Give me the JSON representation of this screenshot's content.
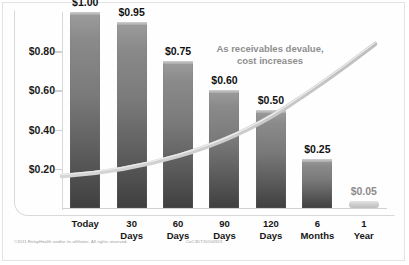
{
  "chart_data": {
    "type": "bar",
    "title": "",
    "subtitle": "",
    "xlabel": "",
    "ylabel": "",
    "categories": [
      "Today",
      "30\nDays",
      "60\nDays",
      "90\nDays",
      "120\nDays",
      "6\nMonths",
      "1\nYear"
    ],
    "category_lines": [
      [
        "Today"
      ],
      [
        "30",
        "Days"
      ],
      [
        "60",
        "Days"
      ],
      [
        "90",
        "Days"
      ],
      [
        "120",
        "Days"
      ],
      [
        "6",
        "Months"
      ],
      [
        "1",
        "Year"
      ]
    ],
    "values": [
      1.0,
      0.95,
      0.75,
      0.6,
      0.5,
      0.25,
      0.05
    ],
    "value_labels": [
      "$1.00",
      "$0.95",
      "$0.75",
      "$0.60",
      "$0.50",
      "$0.25",
      "$0.05"
    ],
    "ylim": [
      0,
      1.0
    ],
    "ytick_values": [
      0.8,
      0.6,
      0.4,
      0.2
    ],
    "ytick_labels": [
      "$0.80",
      "$0.60",
      "$0.40",
      "$0.20"
    ],
    "grid": false,
    "legend": null,
    "annotations": [
      {
        "line1": "As receivables devalue,",
        "line2": "cost increases"
      }
    ],
    "overlay_series": {
      "name": "cost curve",
      "type": "line",
      "description": "rising swoosh curve from lower-left to upper-right"
    },
    "colors": {
      "bar_top": "#9d9d9d",
      "bar_bottom": "#3f3f3f",
      "bar_small": "#cfcfcf",
      "curve": "#c7c7c7",
      "axis": "#d9d9d9",
      "label_text": "#111111",
      "annotation_text": "#8e8e8e",
      "footer_text": "#9a9a9a",
      "background": "#ffffff"
    }
  },
  "footer": {
    "copyright": "©2011 RelayHealth and/or its affiliates. All rights reserved.",
    "code": "CoC3DT20100923"
  }
}
